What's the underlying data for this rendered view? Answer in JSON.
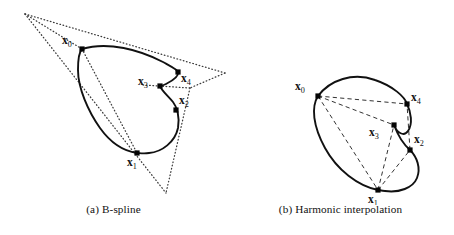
{
  "figure": {
    "panels": [
      {
        "id": "a",
        "caption_tag": "(a)",
        "caption_text": "B-spline",
        "caption_full": "(a) B-spline",
        "control_style": "dotted control polygon",
        "curve_color": "#111111",
        "guide_color": "#3a3a3a",
        "points": [
          {
            "id": "x0",
            "label_var": "x",
            "label_sub": "0",
            "x": 82,
            "y": 49,
            "label_x": 62,
            "label_y": 44
          },
          {
            "id": "x4",
            "label_var": "x",
            "label_sub": "4",
            "x": 178,
            "y": 72,
            "label_x": 181,
            "label_y": 82
          },
          {
            "id": "x3",
            "label_var": "x",
            "label_sub": "3",
            "x": 160,
            "y": 86,
            "label_x": 138,
            "label_y": 85
          },
          {
            "id": "x2",
            "label_var": "x",
            "label_sub": "2",
            "x": 176,
            "y": 110,
            "label_x": 179,
            "label_y": 104
          },
          {
            "id": "x1",
            "label_var": "x",
            "label_sub": "1",
            "x": 137,
            "y": 153,
            "label_x": 127,
            "label_y": 166
          }
        ],
        "control_polygon_vertices": [
          {
            "x": 25,
            "y": 14
          },
          {
            "x": 225,
            "y": 73
          },
          {
            "x": 166,
            "y": 193
          }
        ],
        "control_polygon_inner_vertices": [
          {
            "x": 143,
            "y": 85
          },
          {
            "x": 190,
            "y": 88
          }
        ]
      },
      {
        "id": "b",
        "caption_tag": "(b)",
        "caption_text": "Harmonic interpolation",
        "caption_full": "(b) Harmonic interpolation",
        "control_style": "dashed chord network",
        "curve_color": "#111111",
        "guide_color": "#333333",
        "points": [
          {
            "id": "x0",
            "label_var": "x",
            "label_sub": "0",
            "x": 91,
            "y": 96,
            "label_x": 68,
            "label_y": 90
          },
          {
            "id": "x4",
            "label_var": "x",
            "label_sub": "4",
            "x": 180,
            "y": 104,
            "label_x": 184,
            "label_y": 101
          },
          {
            "id": "x3",
            "label_var": "x",
            "label_sub": "3",
            "x": 167,
            "y": 125,
            "label_x": 142,
            "label_y": 136
          },
          {
            "id": "x2",
            "label_var": "x",
            "label_sub": "2",
            "x": 183,
            "y": 150,
            "label_x": 187,
            "label_y": 143
          },
          {
            "id": "x1",
            "label_var": "x",
            "label_sub": "1",
            "x": 151,
            "y": 190,
            "label_x": 141,
            "label_y": 203
          }
        ],
        "chords": [
          {
            "from": "x0",
            "to": "x4"
          },
          {
            "from": "x0",
            "to": "x3"
          },
          {
            "from": "x0",
            "to": "x1"
          },
          {
            "from": "x1",
            "to": "x3"
          },
          {
            "from": "x1",
            "to": "x2"
          },
          {
            "from": "x2",
            "to": "x4"
          }
        ]
      }
    ]
  },
  "chart_data": {
    "type": "scatter",
    "xlabel": "",
    "ylabel": "",
    "grid": false,
    "legend": null,
    "subplots": [
      {
        "name": "(a) B-spline",
        "point_labels": [
          "x0",
          "x1",
          "x2",
          "x3",
          "x4"
        ],
        "x": [
          82,
          137,
          176,
          160,
          178
        ],
        "y": [
          49,
          153,
          110,
          86,
          72
        ],
        "guide_type": "dotted control polygon",
        "curve_type": "closed periodic B-spline"
      },
      {
        "name": "(b) Harmonic interpolation",
        "point_labels": [
          "x0",
          "x1",
          "x2",
          "x3",
          "x4"
        ],
        "x": [
          91,
          151,
          183,
          167,
          180
        ],
        "y": [
          96,
          190,
          150,
          125,
          104
        ],
        "guide_type": "dashed chords between points",
        "curve_type": "closed harmonic interpolating curve"
      }
    ]
  }
}
